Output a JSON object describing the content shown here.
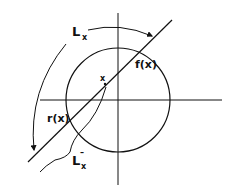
{
  "diagram": {
    "labels": {
      "Lx_main": "L",
      "Lx_main_sub": "x",
      "fx": "f(x)",
      "rx": "r(x)",
      "point_x": "x",
      "Lx_bar": "L",
      "Lx_bar_sub": "x",
      "Lx_bar_sup": "–"
    },
    "colors": {
      "stroke": "#111111",
      "background": "#ffffff"
    }
  }
}
